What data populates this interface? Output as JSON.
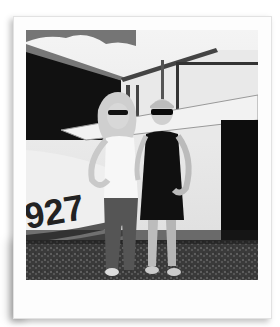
{
  "image": {
    "style": "polaroid-frame",
    "color_mode": "black-and-white",
    "subject": "two women posing in front of a small airplane",
    "visible_text": {
      "fuselage_number": "927"
    },
    "colors": {
      "frame": "#fdfdfd",
      "background": "#ffffff"
    }
  }
}
